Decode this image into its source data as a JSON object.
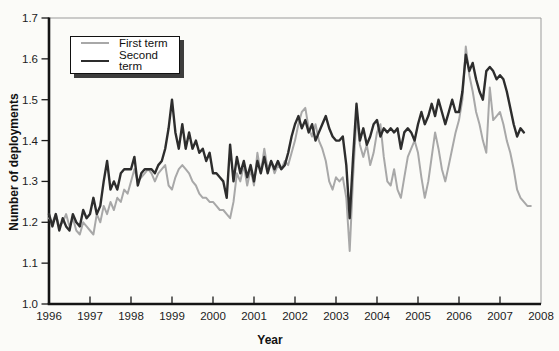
{
  "figure": {
    "xlabel": "Year",
    "ylabel": "Number of deployments",
    "background": "#fbfbf8",
    "legend": [
      {
        "label": "First term",
        "color": "#a8a8a8",
        "line_width": 2.0
      },
      {
        "label": "Second term",
        "color": "#2d2d2d",
        "line_width": 2.4
      }
    ]
  },
  "chart_data": {
    "type": "line",
    "title": "",
    "xlabel": "Year",
    "ylabel": "Number of deployments",
    "xlim": [
      1996,
      2008
    ],
    "ylim": [
      1.0,
      1.7
    ],
    "x_ticks": [
      1996,
      1997,
      1998,
      1999,
      2000,
      2001,
      2002,
      2003,
      2004,
      2005,
      2006,
      2007,
      2008
    ],
    "y_ticks": [
      1.0,
      1.1,
      1.2,
      1.3,
      1.4,
      1.5,
      1.6,
      1.7
    ],
    "grid": false,
    "legend_position": "top-left",
    "series": [
      {
        "name": "First term",
        "color": "#a8a8a8",
        "width": 2.0,
        "start": 1996.0,
        "points_per_year": 12,
        "values": [
          1.21,
          1.2,
          1.22,
          1.19,
          1.2,
          1.22,
          1.19,
          1.21,
          1.18,
          1.17,
          1.2,
          1.19,
          1.18,
          1.17,
          1.22,
          1.2,
          1.24,
          1.22,
          1.25,
          1.23,
          1.26,
          1.25,
          1.28,
          1.27,
          1.3,
          1.33,
          1.3,
          1.31,
          1.32,
          1.33,
          1.32,
          1.3,
          1.32,
          1.33,
          1.34,
          1.29,
          1.28,
          1.31,
          1.33,
          1.34,
          1.33,
          1.32,
          1.3,
          1.29,
          1.27,
          1.26,
          1.26,
          1.25,
          1.25,
          1.24,
          1.23,
          1.23,
          1.22,
          1.21,
          1.25,
          1.32,
          1.3,
          1.34,
          1.29,
          1.33,
          1.29,
          1.37,
          1.32,
          1.38,
          1.33,
          1.35,
          1.32,
          1.34,
          1.33,
          1.35,
          1.34,
          1.37,
          1.4,
          1.44,
          1.47,
          1.48,
          1.43,
          1.41,
          1.44,
          1.4,
          1.38,
          1.35,
          1.3,
          1.28,
          1.31,
          1.3,
          1.31,
          1.26,
          1.13,
          1.31,
          1.46,
          1.39,
          1.36,
          1.39,
          1.34,
          1.37,
          1.42,
          1.44,
          1.36,
          1.3,
          1.29,
          1.33,
          1.28,
          1.26,
          1.31,
          1.36,
          1.38,
          1.4,
          1.37,
          1.31,
          1.26,
          1.3,
          1.36,
          1.42,
          1.38,
          1.33,
          1.3,
          1.34,
          1.38,
          1.42,
          1.45,
          1.5,
          1.63,
          1.56,
          1.52,
          1.47,
          1.44,
          1.4,
          1.37,
          1.53,
          1.45,
          1.46,
          1.47,
          1.44,
          1.4,
          1.37,
          1.33,
          1.28,
          1.26,
          1.25,
          1.24,
          1.24
        ]
      },
      {
        "name": "Second term",
        "color": "#2d2d2d",
        "width": 2.4,
        "start": 1996.0,
        "points_per_year": 12,
        "values": [
          1.22,
          1.19,
          1.22,
          1.18,
          1.21,
          1.19,
          1.18,
          1.22,
          1.2,
          1.19,
          1.23,
          1.21,
          1.22,
          1.26,
          1.22,
          1.24,
          1.3,
          1.35,
          1.28,
          1.3,
          1.28,
          1.32,
          1.33,
          1.33,
          1.33,
          1.36,
          1.29,
          1.32,
          1.33,
          1.33,
          1.33,
          1.32,
          1.34,
          1.35,
          1.38,
          1.43,
          1.5,
          1.42,
          1.38,
          1.44,
          1.38,
          1.42,
          1.38,
          1.4,
          1.37,
          1.38,
          1.35,
          1.37,
          1.32,
          1.32,
          1.31,
          1.3,
          1.26,
          1.39,
          1.3,
          1.36,
          1.32,
          1.35,
          1.31,
          1.34,
          1.3,
          1.35,
          1.32,
          1.36,
          1.32,
          1.35,
          1.33,
          1.35,
          1.33,
          1.34,
          1.37,
          1.41,
          1.44,
          1.46,
          1.43,
          1.45,
          1.42,
          1.44,
          1.4,
          1.42,
          1.44,
          1.46,
          1.43,
          1.41,
          1.4,
          1.4,
          1.41,
          1.34,
          1.21,
          1.36,
          1.49,
          1.4,
          1.43,
          1.39,
          1.41,
          1.44,
          1.45,
          1.41,
          1.43,
          1.42,
          1.43,
          1.42,
          1.43,
          1.38,
          1.42,
          1.43,
          1.42,
          1.4,
          1.44,
          1.47,
          1.44,
          1.46,
          1.49,
          1.46,
          1.5,
          1.47,
          1.44,
          1.47,
          1.5,
          1.47,
          1.47,
          1.52,
          1.61,
          1.57,
          1.59,
          1.55,
          1.52,
          1.5,
          1.57,
          1.58,
          1.57,
          1.55,
          1.56,
          1.55,
          1.52,
          1.48,
          1.44,
          1.41,
          1.43,
          1.42
        ]
      }
    ]
  }
}
